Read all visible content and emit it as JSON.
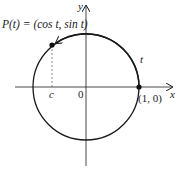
{
  "diagram": {
    "title_label": "P(t) = (cos t, sin t)",
    "point_label_prefix": "P",
    "arc_label": "t",
    "x_axis_label": "x",
    "y_axis_label": "y",
    "origin_label": "0",
    "c_label": "c",
    "point_1_0_label": "(1, 0)"
  }
}
